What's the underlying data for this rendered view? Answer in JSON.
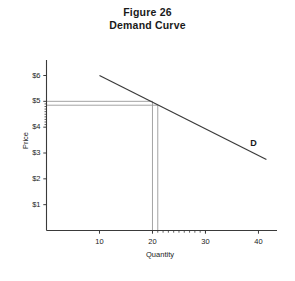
{
  "figure": {
    "title_line1": "Figure 26",
    "title_line2": "Demand Curve",
    "background": "#ffffff",
    "ink_color": "#3a3a3a",
    "guide_color": "#9a9a9a"
  },
  "chart_data": {
    "type": "line",
    "title": "Figure 26 Demand Curve",
    "xlabel": "Quantity",
    "ylabel": "Price",
    "xlim": [
      0,
      43.5
    ],
    "ylim": [
      0,
      6.6
    ],
    "grid": false,
    "legend": "none",
    "x_ticks": [
      10,
      20,
      30,
      40
    ],
    "x_tick_labels": [
      "10",
      "20",
      "30",
      "40"
    ],
    "y_ticks": [
      1,
      2,
      3,
      4,
      5,
      6
    ],
    "y_tick_labels": [
      "$1",
      "$2",
      "$3",
      "$4",
      "$5",
      "$6"
    ],
    "x_minor_ticks": [
      21,
      22,
      23,
      24,
      25,
      26,
      27,
      28,
      29,
      30
    ],
    "y_minor_ticks": [
      4.1,
      4.2,
      4.3,
      4.4,
      4.5,
      4.6,
      4.7,
      4.8,
      4.9
    ],
    "series": [
      {
        "name": "D",
        "label": "D",
        "label_x": 39,
        "label_y": 3.35,
        "x": [
          10,
          41.5
        ],
        "values": [
          6.0,
          2.75
        ]
      }
    ],
    "annotations": [
      {
        "name": "equilibrium-guide-upper",
        "type": "guide",
        "price": 5.0,
        "quantity": 20,
        "h_from_x": 0,
        "v_to_y": 0
      },
      {
        "name": "equilibrium-guide-lower",
        "type": "guide",
        "price": 4.85,
        "quantity": 21,
        "h_from_x": 0,
        "v_to_y": 0
      }
    ]
  }
}
